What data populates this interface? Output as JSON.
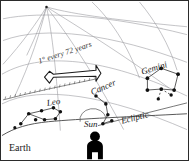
{
  "diagram": {
    "annotations": {
      "rate": "1° every 72 years",
      "earth": "Earth",
      "sun": "Sun",
      "ecliptic": "Ecliptic"
    },
    "constellations": [
      {
        "name": "Leo"
      },
      {
        "name": "Cancer"
      },
      {
        "name": "Gemini"
      }
    ],
    "colors": {
      "border": "#2b2b2b",
      "grid": "#9a9aa0",
      "horizon": "#555555",
      "star": "#111111",
      "figure": "#000000",
      "background": "#ffffff"
    }
  }
}
